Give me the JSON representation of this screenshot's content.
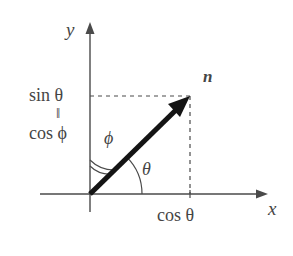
{
  "figure": {
    "background_color": "#ffffff",
    "ink_color": "#454545",
    "vector_color": "#1a1a1a"
  },
  "axes": {
    "x_label": "x",
    "y_label": "y",
    "origin": {
      "x": 90,
      "y": 194
    },
    "x_axis": {
      "start_x": 40,
      "end_x": 268,
      "y": 194,
      "arrow": "right"
    },
    "y_axis": {
      "x": 90,
      "start_y": 212,
      "end_y": 22,
      "arrow": "up"
    }
  },
  "vector": {
    "label": "n",
    "tip": {
      "x": 190,
      "y": 96
    },
    "tail": {
      "x": 90,
      "y": 194
    },
    "style": "bold-arrow"
  },
  "angles": {
    "theta": {
      "label": "θ",
      "from_axis": "x-axis",
      "arc_style": "single",
      "arc_radius": 52,
      "degrees": 45
    },
    "phi": {
      "label": "ϕ",
      "from_axis": "y-axis",
      "arc_style": "double",
      "arc_radius": 34,
      "degrees": 45
    }
  },
  "projections": {
    "y_component": {
      "lines": [
        "sin θ",
        "‖",
        "cos ϕ"
      ],
      "sin_theta": "sin θ",
      "equals_sign": "‖",
      "cos_phi": "cos ϕ",
      "dashed_from": {
        "x": 90,
        "y": 96
      },
      "dashed_to": {
        "x": 190,
        "y": 96
      }
    },
    "x_component": {
      "label": "cos θ",
      "dashed_from": {
        "x": 190,
        "y": 96
      },
      "dashed_to": {
        "x": 190,
        "y": 194
      }
    }
  }
}
